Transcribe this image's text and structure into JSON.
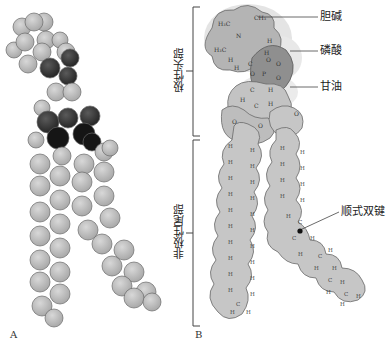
{
  "figure": {
    "panel_a_label": "A",
    "panel_b_label": "B",
    "regions": {
      "polar_head": "极性头部",
      "nonpolar_tail": "非极性尾部"
    },
    "annotations": {
      "choline": "胆碱",
      "phosphate": "磷酸",
      "glycerol": "甘油",
      "cis_double_bond": "顺式双键"
    },
    "atom_labels": {
      "methyl_1": "H₃C",
      "methyl_2": "CH₃",
      "methyl_3": "H₃C",
      "nitrogen": "N⁺",
      "phosphorus": "P",
      "oxygen": "O",
      "carbon": "C",
      "hydrogen": "H"
    },
    "colors": {
      "atom_light": "#c4c4c4",
      "atom_dark": "#3a3a3a",
      "atom_black": "#111111",
      "choline_halo": "#dcdcdc",
      "phosphate_fill": "#8a8a8a",
      "chain_fill": "#c8c8c8",
      "outline": "#555555"
    }
  }
}
